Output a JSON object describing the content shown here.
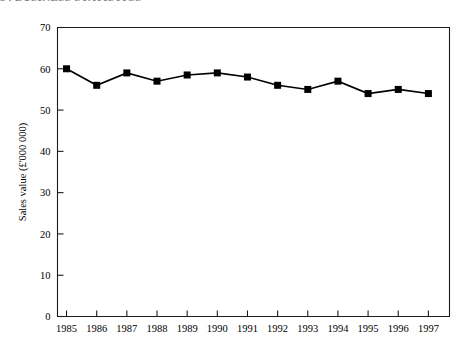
{
  "page": {
    "running_head": "84   BUSINESS STATISTICS"
  },
  "chart_data": {
    "type": "line",
    "title": "",
    "xlabel": "",
    "ylabel": "Sales value (£'000 000)",
    "categories": [
      "1985",
      "1986",
      "1987",
      "1988",
      "1989",
      "1990",
      "1991",
      "1992",
      "1993",
      "1994",
      "1995",
      "1996",
      "1997"
    ],
    "values": [
      60,
      56,
      59,
      57,
      58.5,
      59,
      58,
      56,
      55,
      57,
      54,
      55,
      54
    ],
    "ylim": [
      0,
      70
    ],
    "yticks": [
      0,
      10,
      20,
      30,
      40,
      50,
      60,
      70
    ],
    "ytick_labels": [
      "0",
      "10",
      "20",
      "30",
      "40",
      "50",
      "60",
      "70"
    ],
    "grid": false,
    "legend": "none",
    "marker": "square",
    "marker_color": "#000000",
    "line_color": "#000000"
  }
}
